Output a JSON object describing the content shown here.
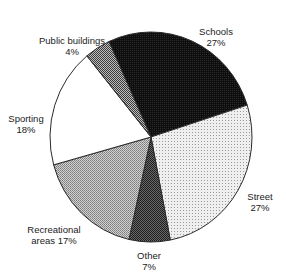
{
  "chart_data": {
    "type": "pie",
    "title": "",
    "categories": [
      "Schools",
      "Street",
      "Other",
      "Recreational areas",
      "Sporting",
      "Public buildings"
    ],
    "values": [
      27,
      27,
      7,
      17,
      18,
      4
    ],
    "unit": "%",
    "start_angle_deg": 335.4,
    "direction": "clockwise",
    "slices": [
      {
        "name": "Schools",
        "value": 27,
        "label_line1": "Schools",
        "label_line2": "27%",
        "fill": "#141414",
        "pattern": "dense-dark-dots",
        "start": 335.4,
        "end": 432.3
      },
      {
        "name": "Street",
        "value": 27,
        "label_line1": "Street",
        "label_line2": "27%",
        "fill": "#e4e4e4",
        "pattern": "light-dots",
        "start": 72.3,
        "end": 169.0
      },
      {
        "name": "Other",
        "value": 7,
        "label_line1": "Other",
        "label_line2": "7%",
        "fill": "#4a4a4a",
        "pattern": "dark-dots",
        "start": 169.0,
        "end": 192.6
      },
      {
        "name": "Recreational areas",
        "value": 17,
        "label_line1": "Recreational",
        "label_line2": "areas 17%",
        "fill": "#b4b4b4",
        "pattern": "medium-dots",
        "start": 192.6,
        "end": 254.6
      },
      {
        "name": "Sporting",
        "value": 18,
        "label_line1": "Sporting",
        "label_line2": "18%",
        "fill": "#ffffff",
        "pattern": "none",
        "start": 254.6,
        "end": 320.6
      },
      {
        "name": "Public buildings",
        "value": 4,
        "label_line1": "Public buildings",
        "label_line2": "4%",
        "fill": "#8a8a8a",
        "pattern": "checker",
        "start": 320.6,
        "end": 335.4
      }
    ],
    "legend": "none (direct labels)",
    "grid": false
  }
}
